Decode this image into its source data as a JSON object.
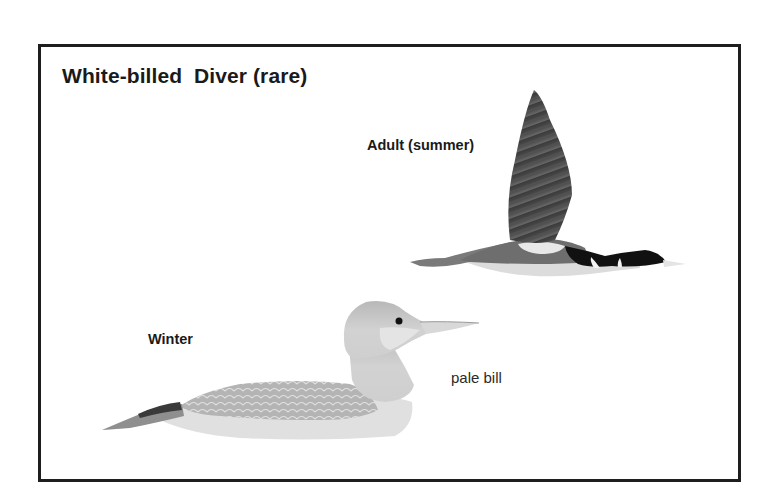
{
  "plate": {
    "title": "White-billed  Diver (rare)",
    "border_color": "#1e1e1e",
    "background": "#ffffff"
  },
  "illustrations": [
    {
      "name": "adult-summer-flying",
      "label": "Adult (summer)",
      "description": "Flying diver in summer plumage: dark wing raised, black head and neck with white patches, pale bill, white underside"
    },
    {
      "name": "winter-swimming",
      "label": "Winter",
      "annotation": "pale bill",
      "description": "Swimming diver in winter plumage: pale grey head and neck, scaled grey back, long pale bill"
    }
  ],
  "colors": {
    "ink": "#1a1a1a",
    "dark_plumage": "#2b2b2b",
    "mid_grey": "#8a8a8a",
    "light_grey": "#c8c8c8",
    "pale": "#e6e6e6"
  }
}
